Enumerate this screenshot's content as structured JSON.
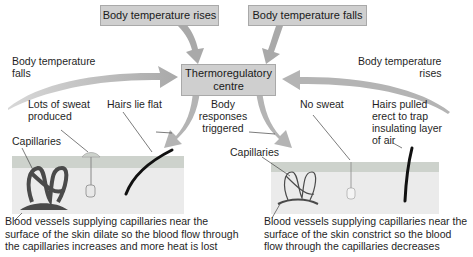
{
  "diagram": {
    "title_boxes": {
      "rises": "Body temperature rises",
      "falls": "Body temperature falls",
      "centre_line1": "Thermoregulatory",
      "centre_line2": "centre"
    },
    "left": {
      "feedback_line1": "Body temperature",
      "feedback_line2": "falls",
      "sweat_line1": "Lots of sweat",
      "sweat_line2": "produced",
      "hairs": "Hairs lie flat",
      "capillaries": "Capillaries",
      "caption_line1": "Blood vessels supplying capillaries near the",
      "caption_line2": "surface of the skin dilate so the blood flow through",
      "caption_line3": "the capillaries increases and more heat is lost"
    },
    "centre": {
      "responses_line1": "Body",
      "responses_line2": "responses",
      "responses_line3": "triggered"
    },
    "right": {
      "feedback_line1": "Body temperature",
      "feedback_line2": "rises",
      "sweat": "No sweat",
      "hairs_line1": "Hairs pulled",
      "hairs_line2": "erect to trap",
      "hairs_line3": "insulating layer",
      "hairs_line4": "of air",
      "capillaries": "Capillaries",
      "caption_line1": "Blood vessels supplying capillaries near the",
      "caption_line2": "surface of the skin constrict so the blood",
      "caption_line3": "flow through the capillaries decreases"
    },
    "colors": {
      "box_fill": "#cfcfcf",
      "arrow_fill": "#b4b4b4",
      "skin_top": "#cdd2cc",
      "skin_body": "#ebebeb",
      "vessel": "#4a4a4a"
    }
  }
}
